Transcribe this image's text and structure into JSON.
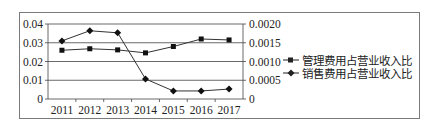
{
  "chart_data": {
    "type": "line",
    "title": "",
    "xlabel": "",
    "ylabel": "",
    "categories": [
      "2011",
      "2012",
      "2013",
      "2014",
      "2015",
      "2016",
      "2017"
    ],
    "left_axis": {
      "ticks": [
        "0",
        "0.01",
        "0.02",
        "0.03",
        "0.04"
      ],
      "ylim": [
        0,
        0.04
      ]
    },
    "right_axis": {
      "ticks": [
        "0",
        "0.0005",
        "0.0010",
        "0.0015",
        "0.0020"
      ],
      "ylim": [
        0,
        0.002
      ]
    },
    "series": [
      {
        "name": "管理费用占营业收入比",
        "marker": "square",
        "axis": "left",
        "values": [
          0.026,
          0.0268,
          0.0262,
          0.0246,
          0.028,
          0.032,
          0.0315
        ]
      },
      {
        "name": "销售费用占营业收入比",
        "marker": "diamond",
        "axis": "left",
        "values": [
          0.031,
          0.0364,
          0.0353,
          0.0107,
          0.0043,
          0.0043,
          0.0053
        ]
      }
    ],
    "grid": true,
    "legend_position": "right",
    "line_color": "#333333"
  },
  "legend": {
    "items": [
      {
        "label": "管理费用占营业收入比",
        "marker": "square"
      },
      {
        "label": "销售费用占营业收入比",
        "marker": "diamond"
      }
    ]
  }
}
